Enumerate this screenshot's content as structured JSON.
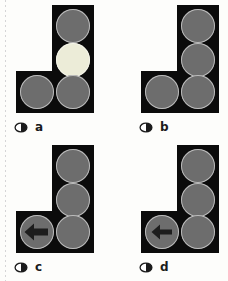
{
  "figure": {
    "kind": "multi-panel-traffic-signal-diagram",
    "panel_count": 4,
    "colors": {
      "housing": "#0b0b0b",
      "lamp_off": "#6d6d6d",
      "lamp_on": "#ececd8",
      "lamp_rim": "#d7d7d7",
      "arrow": "#1d1d1d",
      "background": "#fdfdfb",
      "label_text": "#1b1b1b"
    },
    "panels": [
      {
        "id": "a",
        "caption": "a",
        "bullet": "open-ellipse-bullet",
        "lamps": [
          {
            "slot": "top",
            "state": "off",
            "symbol": "none"
          },
          {
            "slot": "mid",
            "state": "on",
            "symbol": "none"
          },
          {
            "slot": "bottom",
            "state": "off",
            "symbol": "none"
          },
          {
            "slot": "left",
            "state": "off",
            "symbol": "none"
          }
        ]
      },
      {
        "id": "b",
        "caption": "b",
        "bullet": "open-ellipse-bullet",
        "lamps": [
          {
            "slot": "top",
            "state": "off",
            "symbol": "none"
          },
          {
            "slot": "mid",
            "state": "off",
            "symbol": "none"
          },
          {
            "slot": "bottom",
            "state": "off",
            "symbol": "none"
          },
          {
            "slot": "left",
            "state": "off",
            "symbol": "none"
          }
        ]
      },
      {
        "id": "c",
        "caption": "c",
        "bullet": "open-ellipse-bullet",
        "lamps": [
          {
            "slot": "top",
            "state": "off",
            "symbol": "none"
          },
          {
            "slot": "mid",
            "state": "off",
            "symbol": "none"
          },
          {
            "slot": "bottom",
            "state": "off",
            "symbol": "none"
          },
          {
            "slot": "left",
            "state": "off",
            "symbol": "left-arrow-bold"
          }
        ]
      },
      {
        "id": "d",
        "caption": "d",
        "bullet": "open-ellipse-bullet",
        "lamps": [
          {
            "slot": "top",
            "state": "off",
            "symbol": "none"
          },
          {
            "slot": "mid",
            "state": "off",
            "symbol": "none"
          },
          {
            "slot": "bottom",
            "state": "off",
            "symbol": "none"
          },
          {
            "slot": "left",
            "state": "off",
            "symbol": "left-arrow-thin"
          }
        ]
      }
    ]
  }
}
